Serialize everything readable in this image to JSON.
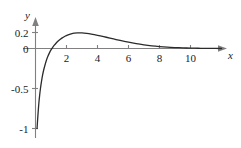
{
  "figure": {
    "background_color": "#ffffff",
    "curve_color": "#2b2b2b",
    "axis_color": "#808080",
    "tick_color": "#808080",
    "text_color": "#1a1a1a"
  },
  "chart_data": {
    "type": "line",
    "title": "",
    "subtitle": "",
    "xlabel": "x",
    "ylabel": "y",
    "xlim": [
      -0.45,
      12.1
    ],
    "ylim": [
      -1.12,
      0.33
    ],
    "grid": false,
    "legend": null,
    "legend_position": "none",
    "x_ticks": [
      2,
      4,
      6,
      8,
      10
    ],
    "x_tick_labels": [
      "2",
      "4",
      "6",
      "8",
      "10"
    ],
    "y_ticks": [
      0.2,
      0,
      -0.5,
      -1
    ],
    "y_tick_labels": [
      "0.2",
      "0",
      "-0.5",
      "-1"
    ],
    "annotations": [],
    "series": [
      {
        "name": "curve",
        "x": [
          0.1,
          0.14,
          0.18,
          0.22,
          0.27,
          0.32,
          0.38,
          0.45,
          0.52,
          0.6,
          0.7,
          0.8,
          0.9,
          1.0,
          1.1,
          1.2,
          1.35,
          1.5,
          1.7,
          1.9,
          2.1,
          2.3,
          2.5,
          2.72,
          3.0,
          3.3,
          3.6,
          4.0,
          4.4,
          4.8,
          5.2,
          5.6,
          6.0,
          6.5,
          7.0,
          7.5,
          8.0,
          8.5,
          9.0,
          9.5,
          10.0,
          10.5,
          11.0,
          11.6,
          12.0
        ],
        "y": [
          -1.0,
          -0.88,
          -0.77,
          -0.675,
          -0.58,
          -0.5,
          -0.42,
          -0.34,
          -0.275,
          -0.215,
          -0.15,
          -0.098,
          -0.055,
          -0.018,
          0.012,
          0.038,
          0.072,
          0.1,
          0.13,
          0.153,
          0.17,
          0.183,
          0.192,
          0.196,
          0.195,
          0.189,
          0.18,
          0.165,
          0.148,
          0.13,
          0.112,
          0.095,
          0.079,
          0.06,
          0.045,
          0.033,
          0.024,
          0.017,
          0.012,
          0.008,
          0.005,
          0.003,
          0.002,
          0.001,
          0.0
        ]
      }
    ]
  }
}
